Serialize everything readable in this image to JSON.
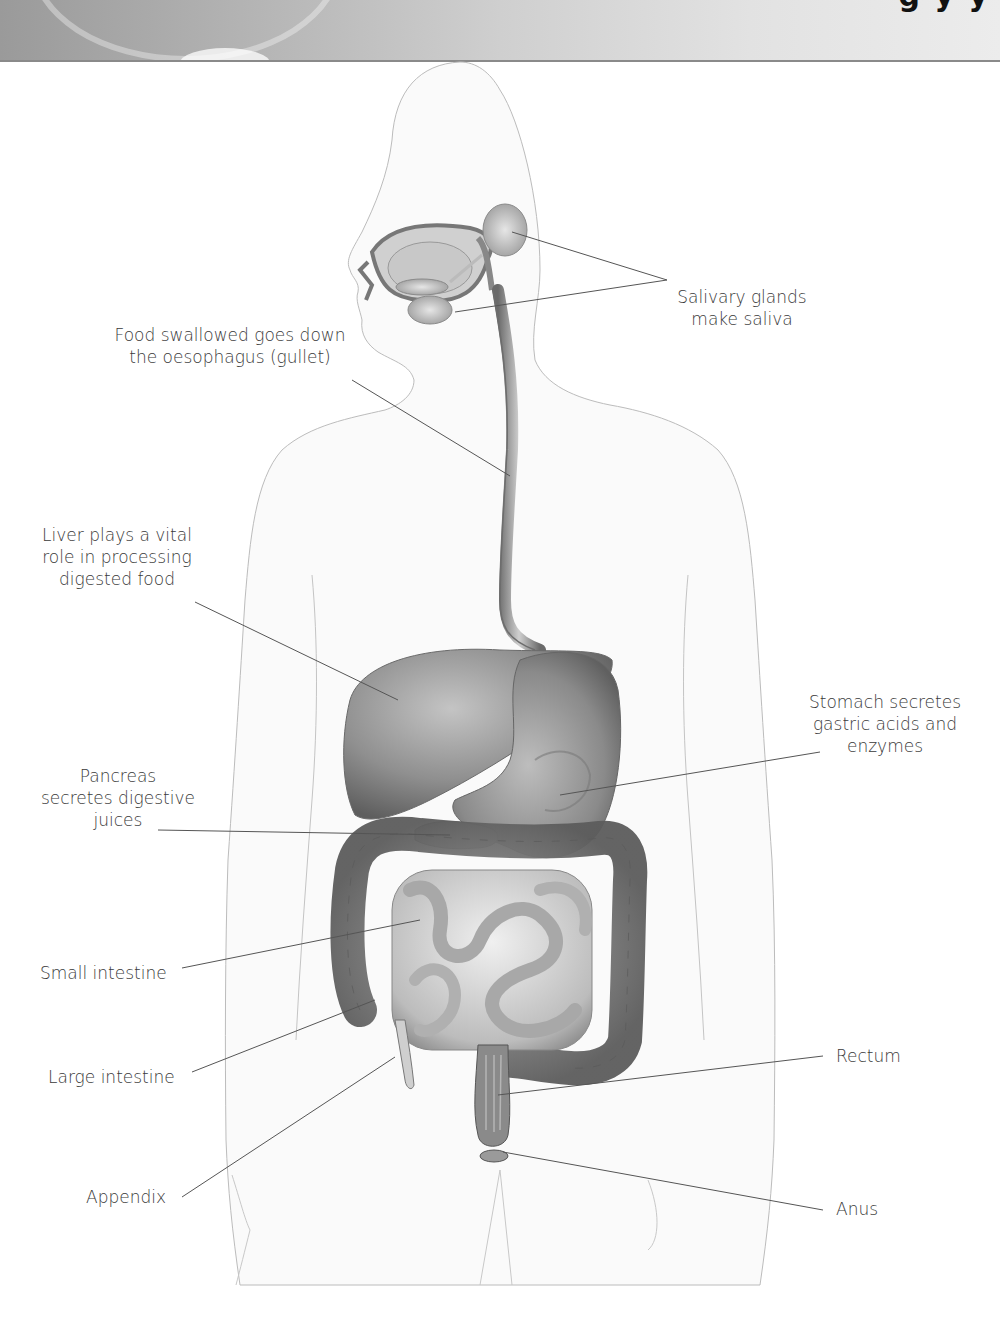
{
  "header": {
    "title_fragment": "g                    y  y"
  },
  "diagram": {
    "labels": [
      {
        "id": "salivary",
        "text": "Salivary glands\nmake saliva"
      },
      {
        "id": "oesophagus",
        "text": "Food swallowed goes down\nthe oesophagus (gullet)"
      },
      {
        "id": "liver",
        "text": "Liver plays a vital\nrole in processing\ndigested food"
      },
      {
        "id": "stomach",
        "text": "Stomach secretes\ngastric acids and\nenzymes"
      },
      {
        "id": "pancreas",
        "text": "Pancreas\nsecretes digestive\njuices"
      },
      {
        "id": "small_intestine",
        "text": "Small intestine"
      },
      {
        "id": "large_intestine",
        "text": "Large intestine"
      },
      {
        "id": "appendix",
        "text": "Appendix"
      },
      {
        "id": "rectum",
        "text": "Rectum"
      },
      {
        "id": "anus",
        "text": "Anus"
      }
    ]
  },
  "colors": {
    "label_text": "#3a3a3a",
    "leader_line": "#555555",
    "body_outline": "#b8b8b8",
    "organ_dark": "#6e6e6e",
    "organ_mid": "#9c9c9c",
    "organ_light": "#d6d6d6"
  }
}
